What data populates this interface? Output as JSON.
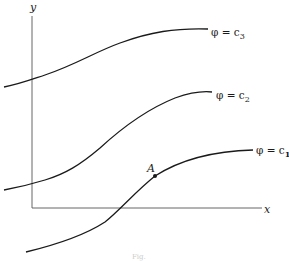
{
  "diagram": {
    "axes": {
      "x_label": "x",
      "y_label": "y"
    },
    "curves": [
      {
        "id": "c3",
        "label": "φ = c",
        "subscript": "3"
      },
      {
        "id": "c2",
        "label": "φ = c",
        "subscript": "2"
      },
      {
        "id": "c1",
        "label": "φ = c",
        "subscript": "1"
      }
    ],
    "point": {
      "label": "A",
      "on_curve": "c1"
    },
    "caption": "Fig."
  }
}
